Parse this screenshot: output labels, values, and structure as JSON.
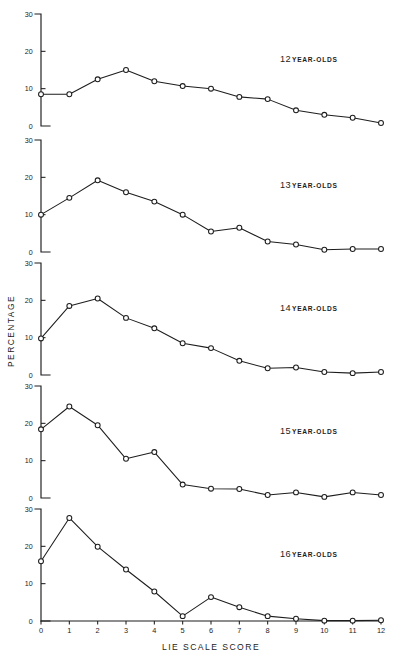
{
  "chart_data": {
    "type": "line",
    "title": "",
    "xlabel": "LIE SCALE SCORE",
    "ylabel": "PERCENTAGE",
    "x": [
      0,
      1,
      2,
      3,
      4,
      5,
      6,
      7,
      8,
      9,
      10,
      11,
      12
    ],
    "xticklabels": [
      "0",
      "1",
      "2",
      "3",
      "4",
      "5",
      "6",
      "7",
      "8",
      "9",
      "10",
      "11",
      "12"
    ],
    "yticks": [
      0,
      10,
      20,
      30
    ],
    "yticklabels": [
      "0",
      "10",
      "20",
      "30"
    ],
    "ylim": [
      0,
      30
    ],
    "xlim": [
      0,
      12
    ],
    "grid": false,
    "legend_position": "inside-panel-right",
    "marker": "open-circle",
    "panels": [
      {
        "id": "panel-12",
        "label_number": "12",
        "label_text": "YEAR-OLDS",
        "label_full": "12 YEAR-OLDS",
        "values": [
          8.5,
          8.5,
          12.5,
          15.0,
          12.0,
          10.7,
          10.0,
          7.8,
          7.2,
          4.2,
          3.0,
          2.2,
          0.8
        ]
      },
      {
        "id": "panel-13",
        "label_number": "13",
        "label_text": "YEAR-OLDS",
        "label_full": "13 YEAR-OLDS",
        "values": [
          10.0,
          14.5,
          19.2,
          16.0,
          13.5,
          10.0,
          5.5,
          6.5,
          2.8,
          2.0,
          0.6,
          0.8,
          0.8
        ]
      },
      {
        "id": "panel-14",
        "label_number": "14",
        "label_text": "YEAR-OLDS",
        "label_full": "14 YEAR-OLDS",
        "values": [
          9.8,
          18.5,
          20.5,
          15.3,
          12.5,
          8.5,
          7.2,
          3.8,
          1.8,
          2.0,
          0.8,
          0.5,
          0.8
        ]
      },
      {
        "id": "panel-15",
        "label_number": "15",
        "label_text": "YEAR-OLDS",
        "label_full": "15 YEAR-OLDS",
        "values": [
          18.4,
          24.5,
          19.5,
          10.5,
          12.3,
          3.6,
          2.5,
          2.4,
          0.8,
          1.5,
          0.3,
          1.5,
          0.8
        ]
      },
      {
        "id": "panel-16",
        "label_number": "16",
        "label_text": "YEAR-OLDS",
        "label_full": "16 YEAR-OLDS",
        "values": [
          16.0,
          27.6,
          19.9,
          13.8,
          7.9,
          1.3,
          6.4,
          3.7,
          1.3,
          0.6,
          0.1,
          0.1,
          0.2
        ]
      }
    ]
  }
}
